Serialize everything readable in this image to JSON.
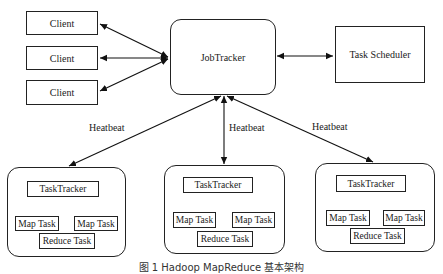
{
  "diagram": {
    "clients": [
      {
        "label": "Client"
      },
      {
        "label": "Client"
      },
      {
        "label": "Client"
      }
    ],
    "job_tracker": {
      "label": "JobTracker"
    },
    "task_scheduler": {
      "label": "Task Scheduler"
    },
    "heartbeat_labels": [
      "Heatbeat",
      "Heatbeat",
      "Heatbeat"
    ],
    "nodes": [
      {
        "task_tracker": "TaskTracker",
        "map_task_1": "Map Task",
        "map_task_2": "Map Task",
        "reduce_task": "Reduce Task"
      },
      {
        "task_tracker": "TaskTracker",
        "map_task_1": "Map Task",
        "map_task_2": "Map Task",
        "reduce_task": "Reduce Task"
      },
      {
        "task_tracker": "TaskTracker",
        "map_task_1": "Map Task",
        "map_task_2": "Map Task",
        "reduce_task": "Reduce Task"
      }
    ],
    "caption": "图 1  Hadoop MapReduce 基本架构"
  }
}
